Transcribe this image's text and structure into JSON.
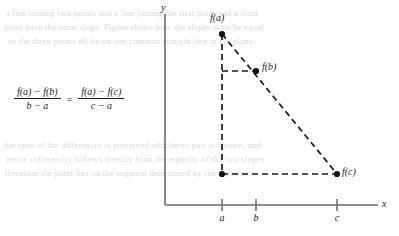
{
  "figure": {
    "kind": "math-diagram",
    "equation": {
      "left": {
        "numerator": "f(a) − f(b)",
        "denominator": "b − a"
      },
      "operator": "=",
      "right": {
        "numerator": "f(a) − f(c)",
        "denominator": "c − a"
      }
    },
    "axes": {
      "x_label": "x",
      "y_label": "y",
      "color": "#6b6b6b",
      "origin_px": {
        "x": 165,
        "y": 205
      },
      "x_end_px": 378,
      "y_top_px": 14
    },
    "ticks": [
      {
        "label": "a",
        "x_px": 222
      },
      {
        "label": "b",
        "x_px": 256
      },
      {
        "label": "c",
        "x_px": 337
      }
    ],
    "points": [
      {
        "name": "point-fa",
        "label": "f(a)",
        "x_px": 222,
        "y_px": 34,
        "label_pos": "above"
      },
      {
        "name": "point-fb",
        "label": "f(b)",
        "x_px": 256,
        "y_px": 71,
        "label_pos": "right"
      },
      {
        "name": "point-fc",
        "label": "f(c)",
        "x_px": 337,
        "y_px": 174,
        "label_pos": "right"
      },
      {
        "name": "point-corner",
        "label": "",
        "x_px": 222,
        "y_px": 174,
        "label_pos": "none"
      }
    ],
    "dashed_segments": [
      {
        "name": "vertical-a-dashed",
        "x1": 222,
        "y1": 34,
        "x2": 222,
        "y2": 174
      },
      {
        "name": "horizontal-base-dashed",
        "x1": 222,
        "y1": 174,
        "x2": 337,
        "y2": 174
      },
      {
        "name": "horizontal-b-dashed",
        "x1": 222,
        "y1": 71,
        "x2": 256,
        "y2": 71
      },
      {
        "name": "secant-line-dashed",
        "x1": 222,
        "y1": 34,
        "x2": 337,
        "y2": 174
      }
    ],
    "style": {
      "ink": "#1a1a1a",
      "axis": "#6b6b6b",
      "dash_pattern": "6,4"
    }
  },
  "background_text": {
    "lines": [
      "a line joining two points and a line joining the first point and a third",
      "point have the same slope. Figure shows how the slopes must be equal",
      "so the three points all lie on one common straight line in the plane.",
      "the ratio of the differences is preserved whichever pair is chosen, and",
      "hence collinearity follows directly from the equality of the two slopes.",
      "therefore the point lies on the segment determined by the other two."
    ]
  }
}
